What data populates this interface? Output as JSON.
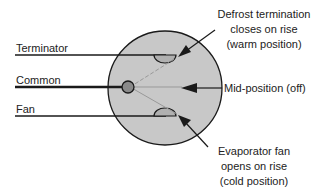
{
  "diagram": {
    "wires": {
      "terminator": "Terminator",
      "common": "Common",
      "fan": "Fan"
    },
    "callouts": {
      "defrost": [
        "Defrost termination",
        "closes on rise",
        "(warm position)"
      ],
      "mid": "Mid-position (off)",
      "evaporator": [
        "Evaporator fan",
        "opens on rise",
        "(cold position)"
      ]
    },
    "colors": {
      "disk_fill": "#c8c8c8",
      "pivot_fill": "#8a8a8a",
      "line": "#1a1a1a"
    }
  }
}
